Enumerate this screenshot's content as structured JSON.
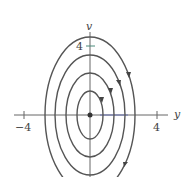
{
  "figure": {
    "type": "phase-plane",
    "x_axis": {
      "label": "y",
      "ticks": [
        {
          "value": -4,
          "label": "−4"
        },
        {
          "value": 4,
          "label": "4"
        }
      ]
    },
    "y_axis": {
      "label": "v",
      "ticks": [
        {
          "value": 4,
          "label": "4"
        }
      ]
    },
    "equilibrium": {
      "y": 0,
      "v": 0
    },
    "orbits": [
      {
        "name": "orbit-1",
        "ry": 1.0,
        "rv": 1.8
      },
      {
        "name": "orbit-2",
        "ry": 1.9,
        "rv": 3.0
      },
      {
        "name": "orbit-3",
        "ry": 2.7,
        "rv": 4.2
      },
      {
        "name": "orbit-4",
        "ry": 3.4,
        "rv": 5.3
      }
    ],
    "direction": "clockwise",
    "colors": {
      "curve": "#555555",
      "axis": "#666666",
      "tick_accent": "#4a8a7a",
      "axis_accent": "#6670b0"
    }
  }
}
